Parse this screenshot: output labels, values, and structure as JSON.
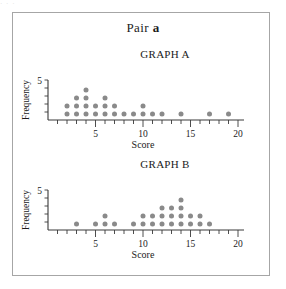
{
  "figure": {
    "top_bleed_text": "· · ·",
    "pair_title_prefix": "Pair ",
    "pair_title_letter": "a",
    "border_color": "#a6a6a6",
    "dot_color": "#8a8a8a",
    "axis_color": "#3a3a3a"
  },
  "graph_a": {
    "label": "GRAPH A",
    "xlabel": "Score",
    "ylabel": "Frequency",
    "y_max_label": "5",
    "x_tick_labels": [
      "5",
      "10",
      "15",
      "20"
    ]
  },
  "graph_b": {
    "label": "GRAPH B",
    "xlabel": "Score",
    "ylabel": "Frequency",
    "y_max_label": "5",
    "x_tick_labels": [
      "5",
      "10",
      "15",
      "20"
    ]
  },
  "chart_data": [
    {
      "type": "bar",
      "subtype": "dotplot",
      "title": "GRAPH A",
      "xlabel": "Score",
      "ylabel": "Frequency",
      "xlim": [
        0,
        20
      ],
      "ylim": [
        0,
        5
      ],
      "grid": false,
      "legend": null,
      "x_ticks": [
        1,
        2,
        3,
        4,
        5,
        6,
        7,
        8,
        9,
        10,
        11,
        12,
        13,
        14,
        15,
        16,
        17,
        18,
        19,
        20
      ],
      "x_tick_labels_shown": [
        5,
        10,
        15,
        20
      ],
      "y_ticks": [
        1,
        2,
        3,
        4,
        5
      ],
      "y_tick_labels_shown": [
        5
      ],
      "categories": [
        2,
        3,
        4,
        5,
        6,
        7,
        8,
        9,
        10,
        11,
        12,
        14,
        17,
        19
      ],
      "values": [
        2,
        3,
        4,
        2,
        3,
        2,
        1,
        1,
        2,
        1,
        1,
        1,
        1,
        1
      ],
      "skew": "right"
    },
    {
      "type": "bar",
      "subtype": "dotplot",
      "title": "GRAPH B",
      "xlabel": "Score",
      "ylabel": "Frequency",
      "xlim": [
        0,
        20
      ],
      "ylim": [
        0,
        5
      ],
      "grid": false,
      "legend": null,
      "x_ticks": [
        1,
        2,
        3,
        4,
        5,
        6,
        7,
        8,
        9,
        10,
        11,
        12,
        13,
        14,
        15,
        16,
        17,
        18,
        19,
        20
      ],
      "x_tick_labels_shown": [
        5,
        10,
        15,
        20
      ],
      "y_ticks": [
        1,
        2,
        3,
        4,
        5
      ],
      "y_tick_labels_shown": [
        5
      ],
      "categories": [
        3,
        5,
        6,
        7,
        9,
        10,
        11,
        12,
        13,
        14,
        15,
        16,
        17
      ],
      "values": [
        1,
        1,
        2,
        1,
        1,
        2,
        2,
        3,
        3,
        4,
        2,
        2,
        1
      ],
      "skew": "left"
    }
  ]
}
